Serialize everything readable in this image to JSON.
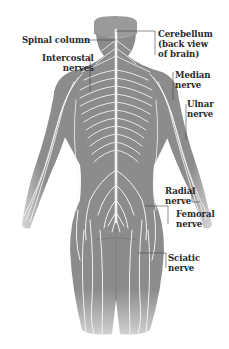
{
  "figure": {
    "colors": {
      "body": "#8c8c8c",
      "nerve": "#f2f2f2",
      "leader": "#444444",
      "label": "#2a2a2a",
      "background": "#ffffff"
    }
  },
  "labels": {
    "spinal_column": "Spinal column",
    "intercostal_1": "Intercostal",
    "intercostal_2": "nerves",
    "cerebellum_1": "Cerebellum",
    "cerebellum_2": "(back view",
    "cerebellum_3": "of brain)",
    "median_1": "Median",
    "median_2": "nerve",
    "ulnar_1": "Ulnar",
    "ulnar_2": "nerve",
    "radial_1": "Radial",
    "radial_2": "nerve",
    "femoral_1": "Femoral",
    "femoral_2": "nerve",
    "sciatic_1": "Sciatic",
    "sciatic_2": "nerve"
  }
}
